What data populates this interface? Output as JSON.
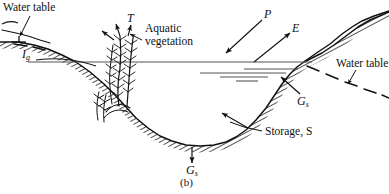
{
  "figure": {
    "caption": "(b)",
    "type": "stream-cross-section-water-balance-diagram",
    "colors": {
      "ink": "#111111",
      "background": "#ffffff",
      "water_surface": "#555555"
    }
  },
  "labels": {
    "water_table_left": "Water table",
    "water_table_right": "Water table",
    "aquatic_vegetation_line1": "Aquatic",
    "aquatic_vegetation_line2": "vegetation",
    "storage": "Storage, S",
    "caption": "(b)"
  },
  "symbols": {
    "transpiration": {
      "base": "T",
      "sub": ""
    },
    "precipitation": {
      "base": "P",
      "sub": ""
    },
    "evaporation": {
      "base": "E",
      "sub": ""
    },
    "inflow_ground": {
      "base": "I",
      "sub": "g"
    },
    "ground_seepage_right": {
      "base": "G",
      "sub": "s"
    },
    "ground_seepage_bottom": {
      "base": "G",
      "sub": "s"
    },
    "ground_seepage_upper_right": {
      "base": "G",
      "sub": "s"
    },
    "storage_symbol": {
      "base": "S",
      "sub": ""
    }
  },
  "annotations": [
    {
      "name": "water-table-left",
      "text": "Water table",
      "x": 4,
      "y": 2
    },
    {
      "name": "inflow-ground-label",
      "text": "I g",
      "x": 22,
      "y": 50
    },
    {
      "name": "transpiration-label",
      "text": "T",
      "x": 126,
      "y": 16
    },
    {
      "name": "aquatic-vegetation-label",
      "text": "Aquatic vegetation",
      "x": 144,
      "y": 28
    },
    {
      "name": "precipitation-label",
      "text": "P",
      "x": 262,
      "y": 10
    },
    {
      "name": "evaporation-label",
      "text": "E",
      "x": 291,
      "y": 24
    },
    {
      "name": "water-table-right",
      "text": "Water table",
      "x": 337,
      "y": 59
    },
    {
      "name": "ground-seepage-right-label",
      "text": "G s",
      "x": 296,
      "y": 96
    },
    {
      "name": "storage-label",
      "text": "Storage, S",
      "x": 265,
      "y": 129
    },
    {
      "name": "ground-seepage-bottom-label",
      "text": "G s",
      "x": 186,
      "y": 166
    },
    {
      "name": "figure-caption",
      "text": "(b)",
      "x": 186,
      "y": 178
    }
  ]
}
